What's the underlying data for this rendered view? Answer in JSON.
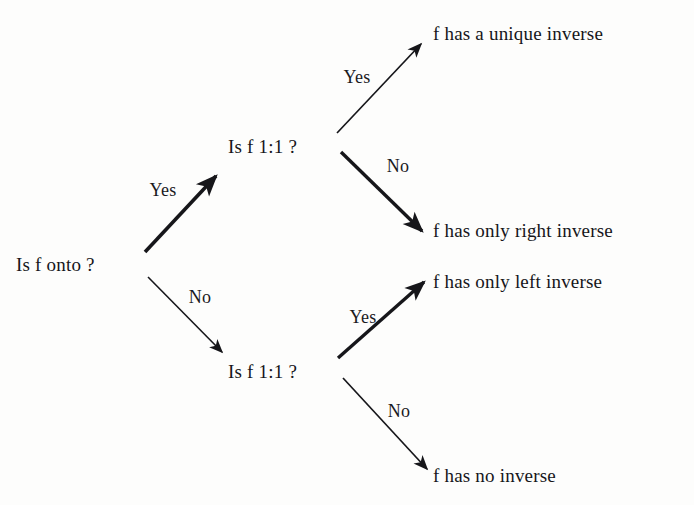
{
  "diagram": {
    "background_color": "#fdfdfc",
    "ink_color": "#16161a",
    "nodes": {
      "root": "Is f onto ?",
      "upper_decision": "Is f 1:1 ?",
      "lower_decision": "Is f 1:1 ?",
      "leaf_unique": "f has a unique inverse",
      "leaf_right": "f has only right inverse",
      "leaf_left": "f has only left inverse",
      "leaf_none": "f has no inverse"
    },
    "edges": [
      {
        "label": "Yes",
        "from": "root",
        "to": "upper_decision",
        "weight": "thick"
      },
      {
        "label": "No",
        "from": "root",
        "to": "lower_decision",
        "weight": "thin"
      },
      {
        "label": "Yes",
        "from": "upper_decision",
        "to": "leaf_unique",
        "weight": "thin"
      },
      {
        "label": "No",
        "from": "upper_decision",
        "to": "leaf_right",
        "weight": "thick"
      },
      {
        "label": "Yes",
        "from": "lower_decision",
        "to": "leaf_left",
        "weight": "thick"
      },
      {
        "label": "No",
        "from": "lower_decision",
        "to": "leaf_none",
        "weight": "thin"
      }
    ],
    "edge_labels": {
      "root_yes": "Yes",
      "root_no": "No",
      "upper_yes": "Yes",
      "upper_no": "No",
      "lower_yes": "Yes",
      "lower_no": "No"
    }
  }
}
